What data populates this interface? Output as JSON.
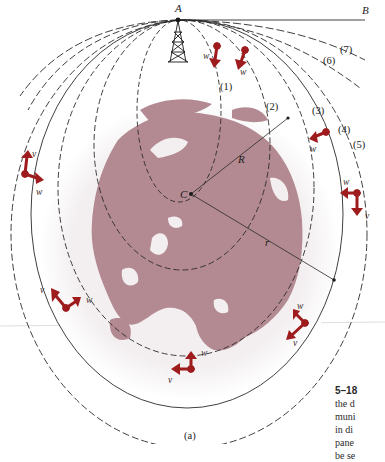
{
  "figure": {
    "point_labels": {
      "A": "A",
      "B": "B",
      "C": "C",
      "R": "R",
      "r": "r"
    },
    "orbit_labels": [
      "(1)",
      "(2)",
      "(3)",
      "(4)",
      "(5)",
      "(6)",
      "(7)"
    ],
    "vector_labels": {
      "v": "v",
      "w": "w"
    },
    "subfigure_label": "(a)",
    "colors": {
      "earth_land": "#b38a92",
      "earth_halo": "#f1eced",
      "vector_red": "#9e1b1e",
      "line": "#2a2a2a"
    }
  },
  "caption": {
    "figure_number": "5–18",
    "lines": [
      "the d",
      "muni",
      "in di",
      "pane",
      "be se"
    ]
  }
}
